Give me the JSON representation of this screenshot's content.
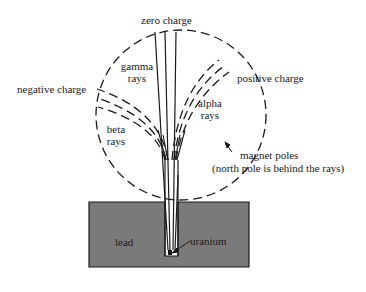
{
  "diagram": {
    "type": "radioactive decay rays in magnetic field",
    "labels": {
      "zero_charge": "zero charge",
      "gamma": [
        "gamma",
        "rays"
      ],
      "positive_charge": "positive charge",
      "negative_charge": "negative charge",
      "alpha": [
        "alpha",
        "rays"
      ],
      "beta": [
        "beta",
        "rays"
      ],
      "magnet_poles": "magnet poles",
      "north_pole_note": "(north pole is behind the rays)",
      "lead": "lead",
      "uranium": "uranium"
    },
    "colors": {
      "lead_fill": "#7a7a7a",
      "line": "#1a1a1a",
      "background": "#ffffff"
    }
  }
}
